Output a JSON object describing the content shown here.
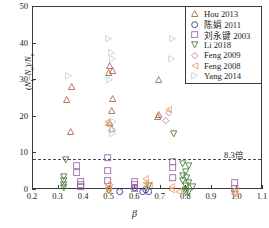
{
  "chart_data": {
    "type": "scatter",
    "title": "",
    "xlabel": "β",
    "ylabel": "(Nt−Nc)/Nc",
    "xlim": [
      0.2,
      1.1
    ],
    "ylim": [
      0,
      50
    ],
    "xticks": [
      "0.2",
      "0.3",
      "0.4",
      "0.5",
      "0.6",
      "0.7",
      "0.8",
      "0.9",
      "1.0",
      "1.1"
    ],
    "yticks": [
      "0",
      "10",
      "20",
      "30",
      "40",
      "50"
    ],
    "grid": false,
    "legend_position": "top-right",
    "annotations": [
      {
        "text": "8.3倍",
        "y": 8.3,
        "x": 1.04,
        "line": "horizontal-dashed"
      }
    ],
    "threshold_value": 8.3,
    "series": [
      {
        "name": "Hou 2013",
        "marker": "triangle-up",
        "color": "#a86b4c",
        "points": [
          [
            0.355,
            29.7
          ],
          [
            0.335,
            26.1
          ],
          [
            0.35,
            17.4
          ],
          [
            0.505,
            35.4
          ],
          [
            0.5,
            33.6
          ],
          [
            0.515,
            34.0
          ],
          [
            0.515,
            26.5
          ],
          [
            0.51,
            23.2
          ],
          [
            0.505,
            19.9
          ],
          [
            0.51,
            18.2
          ],
          [
            0.695,
            31.7
          ],
          [
            0.695,
            22.0
          ],
          [
            0.69,
            21.5
          ]
        ]
      },
      {
        "name": "陈娟 2011",
        "marker": "circle",
        "color": "#2e3f8f",
        "points": [
          [
            0.545,
            1.0
          ],
          [
            0.6,
            2.1
          ],
          [
            0.635,
            1.1
          ],
          [
            0.655,
            1.0
          ],
          [
            0.645,
            1.6
          ]
        ]
      },
      {
        "name": "刘永键 2003",
        "marker": "square",
        "color": "#9a6aa8",
        "points": [
          [
            0.375,
            8.2
          ],
          [
            0.375,
            6.3
          ],
          [
            0.392,
            3.9
          ],
          [
            0.392,
            2.9
          ],
          [
            0.392,
            2.3
          ],
          [
            0.497,
            10.3
          ],
          [
            0.497,
            6.9
          ],
          [
            0.497,
            4.2
          ],
          [
            0.6,
            3.7
          ],
          [
            0.6,
            2.9
          ],
          [
            0.6,
            2.0
          ],
          [
            0.752,
            9.4
          ],
          [
            0.752,
            7.6
          ],
          [
            0.752,
            4.8
          ],
          [
            0.995,
            3.5
          ],
          [
            0.995,
            1.9
          ]
        ]
      },
      {
        "name": "Li 2018",
        "marker": "triangle-down",
        "color": "#4f7a3c",
        "points": [
          [
            0.33,
            9.8
          ],
          [
            0.325,
            5.3
          ],
          [
            0.325,
            4.2
          ],
          [
            0.325,
            3.1
          ],
          [
            0.325,
            2.1
          ],
          [
            0.5,
            1.4
          ],
          [
            0.655,
            2.7
          ],
          [
            0.755,
            16.8
          ],
          [
            0.79,
            8.6
          ],
          [
            0.815,
            8.3
          ],
          [
            0.8,
            6.6
          ],
          [
            0.79,
            5.4
          ],
          [
            0.805,
            5.0
          ],
          [
            0.79,
            4.0
          ],
          [
            0.815,
            3.6
          ],
          [
            0.8,
            2.7
          ],
          [
            0.83,
            2.4
          ],
          [
            0.8,
            1.6
          ],
          [
            0.815,
            1.2
          ],
          [
            0.8,
            0.8
          ]
        ]
      },
      {
        "name": "Feng 2009",
        "marker": "diamond",
        "color": "#cf7f97",
        "points": [
          [
            0.505,
            2.9
          ],
          [
            0.505,
            1.9
          ],
          [
            0.725,
            20.6
          ],
          [
            0.735,
            22.6
          ],
          [
            0.995,
            1.2
          ],
          [
            0.995,
            0.5
          ]
        ]
      },
      {
        "name": "Feng 2008",
        "marker": "triangle-left",
        "color": "#e8a060",
        "points": [
          [
            0.495,
            20.1
          ],
          [
            0.495,
            19.4
          ],
          [
            0.497,
            3.1
          ],
          [
            0.497,
            2.1
          ],
          [
            0.5,
            1.1
          ],
          [
            0.645,
            4.5
          ],
          [
            0.645,
            3.5
          ],
          [
            0.645,
            2.4
          ],
          [
            0.66,
            3.0
          ],
          [
            0.735,
            23.4
          ],
          [
            0.745,
            2.3
          ],
          [
            0.745,
            1.5
          ],
          [
            0.775,
            1.0
          ],
          [
            0.995,
            1.5
          ],
          [
            0.995,
            0.6
          ]
        ]
      },
      {
        "name": "Yang 2014",
        "marker": "triangle-right",
        "color": "#b9d7e8",
        "points": [
          [
            0.345,
            32.7
          ],
          [
            0.5,
            43.0
          ],
          [
            0.51,
            39.1
          ],
          [
            0.515,
            37.5
          ],
          [
            0.505,
            31.6
          ],
          [
            0.52,
            20.2
          ],
          [
            0.52,
            18.0
          ],
          [
            0.515,
            16.8
          ],
          [
            0.75,
            43.0
          ],
          [
            0.745,
            37.5
          ]
        ]
      }
    ]
  },
  "legend": {
    "items": [
      {
        "label": "Hou 2013"
      },
      {
        "label": "陈娟 2011"
      },
      {
        "label": "刘永键 2003"
      },
      {
        "label": "Li 2018"
      },
      {
        "label": "Feng 2009"
      },
      {
        "label": "Feng 2008"
      },
      {
        "label": "Yang 2014"
      }
    ]
  },
  "axes": {
    "y_title_main": "(N",
    "y_title": "(Nt–Nc)/Nc",
    "x_title": "β"
  }
}
